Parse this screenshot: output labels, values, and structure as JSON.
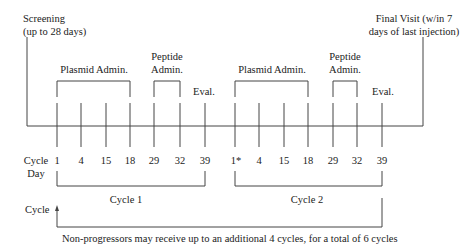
{
  "phases": {
    "screening": {
      "line1": "Screening",
      "line2": "(up to 28 days)"
    },
    "final_visit": {
      "line1": "Final Visit (w/in 7",
      "line2": "days of last injection)"
    }
  },
  "cycles": [
    {
      "plasmid_label": "Plasmid Admin.",
      "peptide_label_line1": "Peptide",
      "peptide_label_line2": "Admin.",
      "eval_label": "Eval.",
      "days": [
        "1",
        "4",
        "15",
        "18",
        "29",
        "32",
        "39"
      ],
      "name": "Cycle 1"
    },
    {
      "plasmid_label": "Plasmid Admin.",
      "peptide_label_line1": "Peptide",
      "peptide_label_line2": "Admin.",
      "eval_label": "Eval.",
      "days": [
        "1*",
        "4",
        "15",
        "18",
        "29",
        "32",
        "39"
      ],
      "name": "Cycle 2"
    }
  ],
  "axis_labels": {
    "cycle_day_line1": "Cycle",
    "cycle_day_line2": "Day",
    "cycle": "Cycle"
  },
  "footnote": "Non-progressors may receive up to an additional 4 cycles, for a total of 6 cycles"
}
